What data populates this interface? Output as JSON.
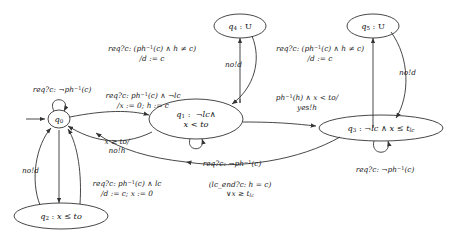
{
  "diagram": {
    "type": "timed-automaton-state-machine",
    "width": 470,
    "height": 244,
    "background": "#ffffff",
    "stroke": "#333333"
  },
  "states": [
    {
      "id": "q0",
      "label": "q0",
      "invariant": "",
      "display": "q0",
      "cx": 59,
      "cy": 119,
      "rx": 11,
      "ry": 9,
      "initial": true
    },
    {
      "id": "q1",
      "label": "q1",
      "invariant": "¬lc∧ x < to",
      "display": "q1 : ¬lc∧ x < to",
      "cx": 196,
      "cy": 119,
      "rx": 47,
      "ry": 20,
      "initial": false
    },
    {
      "id": "q2",
      "label": "q2",
      "invariant": "x ≤ to",
      "display": "q2 : x ≤ to",
      "cx": 61,
      "cy": 216,
      "rx": 47,
      "ry": 13,
      "initial": false
    },
    {
      "id": "q3",
      "label": "q3",
      "invariant": "¬lc ∧ x ≤ tlc",
      "display": "q3 : ¬lc ∧ x ≤ tlc",
      "cx": 381,
      "cy": 128,
      "rx": 62,
      "ry": 13,
      "initial": false
    },
    {
      "id": "q4",
      "label": "q4",
      "invariant": "U",
      "display": "q4 : U",
      "cx": 240,
      "cy": 26,
      "rx": 26,
      "ry": 12,
      "initial": false
    },
    {
      "id": "q5",
      "label": "q5",
      "invariant": "U",
      "display": "q5 : U",
      "cx": 373,
      "cy": 26,
      "rx": 26,
      "ry": 12,
      "initial": false
    }
  ],
  "transitions": [
    {
      "id": "t-q0-self",
      "from": "q0",
      "to": "q0",
      "guard": "req?c: ¬ph−1(c)",
      "action": "",
      "label_x": 62,
      "label_y": 88
    },
    {
      "id": "t-q0-q1",
      "from": "q0",
      "to": "q1",
      "guard": "req?c: ph−1(c) ∧ ¬lc",
      "action": "/x := 0; h := c",
      "label_x": 143,
      "label_y": 94
    },
    {
      "id": "t-q1-q0",
      "from": "q1",
      "to": "q0",
      "guard": "x ≥ to/",
      "action": "no!h",
      "label_x": 117,
      "label_y": 141
    },
    {
      "id": "t-q1-self",
      "from": "q1",
      "to": "q1",
      "guard": "req?c: ¬ph−1(c)",
      "action": "",
      "label_x": 232,
      "label_y": 162
    },
    {
      "id": "t-q0-q4",
      "from": "q0",
      "to": "q4",
      "guard": "req?c: (ph−1(c) ∧ h ≠ c)",
      "action": "/d := c",
      "label_x": 152,
      "label_y": 47
    },
    {
      "id": "t-q4-q0",
      "from": "q4",
      "to": "q0",
      "guard": "no!d",
      "action": "",
      "label_x": 236,
      "label_y": 64
    },
    {
      "id": "t-q1-q5",
      "from": "q1",
      "to": "q5",
      "guard": "req?c: (ph−1(c) ∧ h ≠ c)",
      "action": "/d := c",
      "label_x": 320,
      "label_y": 47
    },
    {
      "id": "t-q5-q1",
      "from": "q5",
      "to": "q1",
      "guard": "no!d",
      "action": "",
      "label_x": 409,
      "label_y": 72
    },
    {
      "id": "t-q1-q3",
      "from": "q1",
      "to": "q3",
      "guard": "ph−1(h) ∧ x < to/",
      "action": "yes!h",
      "label_x": 307,
      "label_y": 96
    },
    {
      "id": "t-q3-self",
      "from": "q3",
      "to": "q3",
      "guard": "req?c: ¬ph−1(c)",
      "action": "",
      "label_x": 385,
      "label_y": 168
    },
    {
      "id": "t-q3-q1",
      "from": "q3",
      "to": "q1",
      "guard": "(lc_end?c: h = c)",
      "action": "∨x ≥ tlc",
      "label_x": 240,
      "label_y": 184
    },
    {
      "id": "t-q0-q2",
      "from": "q0",
      "to": "q2",
      "guard": "req?c: ph−1(c) ∧ lc",
      "action": "/d := c; x := 0",
      "label_x": 127,
      "label_y": 182
    },
    {
      "id": "t-q2-q0",
      "from": "q2",
      "to": "q0",
      "guard": "no!d",
      "action": "",
      "label_x": 33,
      "label_y": 170
    }
  ]
}
